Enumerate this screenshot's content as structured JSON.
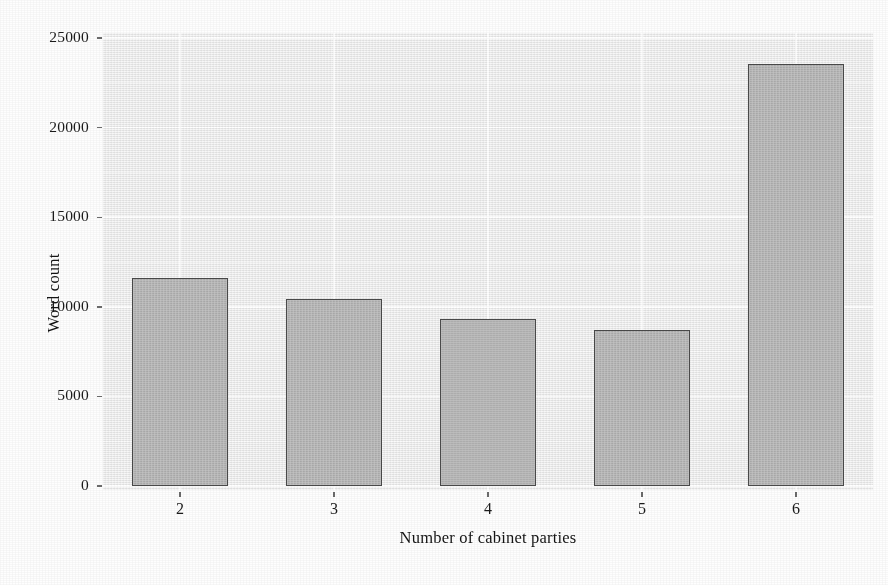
{
  "chart_data": {
    "type": "bar",
    "title": "",
    "subtitle": "",
    "xlabel": "Number of cabinet parties",
    "ylabel": "Word count",
    "categories": [
      "2",
      "3",
      "4",
      "5",
      "6"
    ],
    "values": [
      11635,
      10435,
      9320,
      8705,
      23550
    ],
    "series": [
      {
        "name": "Word count",
        "values": [
          11635,
          10435,
          9320,
          8705,
          23550
        ]
      }
    ],
    "ylim": [
      0,
      25000
    ],
    "ytick_labels": [
      "0",
      "5000",
      "10000",
      "15000",
      "20000",
      "25000"
    ],
    "ytick_values": [
      0,
      5000,
      10000,
      15000,
      20000,
      25000
    ],
    "xtick_labels": [
      "2",
      "3",
      "4",
      "5",
      "6"
    ],
    "grid": true,
    "grid_axis": "both",
    "legend": false,
    "legend_position": "none",
    "annotations": []
  },
  "style": {
    "panel_background": "#f0f0f0",
    "page_background": "#ffffff",
    "gridline_color": "#ffffff",
    "bar_fill": "#b4b4b4",
    "bar_border": "#4a4a4a",
    "text_color": "#1b1b1b",
    "tick_color": "#6b6b6b"
  },
  "caption": {
    "text": ""
  }
}
